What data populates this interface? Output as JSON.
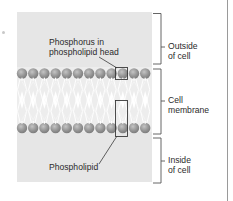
{
  "diagram": {
    "annotations": {
      "phosphorus": "Phosphorus in phospholipid head",
      "phosphorus_line1": "Phosphorus in",
      "phosphorus_line2": "phospholipid head",
      "phospholipid": "Phospholipid"
    },
    "regions": [
      {
        "line1": "Outside",
        "line2": "of cell"
      },
      {
        "line1": "Cell",
        "line2": "membrane"
      },
      {
        "line1": "Inside",
        "line2": "of cell"
      }
    ],
    "heads_per_layer": 12,
    "colors": {
      "background": "#e6e6e6",
      "head": "#8f8f8f",
      "head_highlight": "#c4c4c4",
      "tail": "#ffffff",
      "line": "#3a3a3a"
    }
  }
}
